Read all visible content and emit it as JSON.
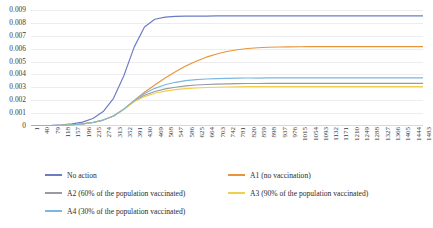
{
  "chart_data": {
    "type": "line",
    "title": "",
    "title_visibility": "cropped at top edge, illegible",
    "xlabel": "",
    "ylabel": "",
    "xlim": [
      1,
      1483
    ],
    "ylim": [
      0,
      0.009
    ],
    "grid": true,
    "grid_axis": "y",
    "legend_position": "bottom",
    "x_tick_step": 39,
    "x": [
      1,
      40,
      79,
      118,
      157,
      196,
      235,
      274,
      313,
      352,
      391,
      430,
      469,
      508,
      547,
      586,
      625,
      664,
      703,
      742,
      781,
      820,
      859,
      898,
      937,
      976,
      1015,
      1054,
      1093,
      1132,
      1171,
      1210,
      1249,
      1288,
      1327,
      1366,
      1405,
      1444,
      1483
    ],
    "y_ticks": [
      "0",
      "0.001",
      "0.002",
      "0.003",
      "0.004",
      "0.005",
      "0.006",
      "0.007",
      "0.008",
      "0.009"
    ],
    "series": [
      {
        "name": "No action",
        "color": "#6c7cc4",
        "values": [
          2e-05,
          3e-05,
          5e-05,
          9e-05,
          0.00016,
          0.0003,
          0.00058,
          0.00112,
          0.00215,
          0.0039,
          0.00612,
          0.00768,
          0.00828,
          0.00845,
          0.0085,
          0.00852,
          0.00853,
          0.00853,
          0.00854,
          0.00854,
          0.00854,
          0.00854,
          0.00854,
          0.00854,
          0.00854,
          0.00854,
          0.00854,
          0.00854,
          0.00854,
          0.00854,
          0.00854,
          0.00854,
          0.00854,
          0.00854,
          0.00854,
          0.00854,
          0.00854,
          0.00854,
          0.00854
        ]
      },
      {
        "name": "A1 (no vaccination)",
        "color": "#e8943a",
        "values": [
          2e-05,
          3e-05,
          4e-05,
          6e-05,
          0.0001,
          0.00016,
          0.00027,
          0.00046,
          0.00078,
          0.00131,
          0.00198,
          0.00262,
          0.00318,
          0.00372,
          0.00421,
          0.00465,
          0.00503,
          0.00534,
          0.00559,
          0.00578,
          0.00592,
          0.00601,
          0.00607,
          0.00611,
          0.00613,
          0.00614,
          0.00615,
          0.00616,
          0.00616,
          0.00616,
          0.00616,
          0.00616,
          0.00616,
          0.00616,
          0.00616,
          0.00616,
          0.00616,
          0.00616,
          0.00616
        ]
      },
      {
        "name": "A2 (60% of the population vaccinated)",
        "color": "#9a9aa2",
        "values": [
          2e-05,
          3e-05,
          4e-05,
          6e-05,
          0.0001,
          0.00016,
          0.00027,
          0.00046,
          0.00078,
          0.0013,
          0.00193,
          0.00238,
          0.00268,
          0.00288,
          0.00301,
          0.00311,
          0.00318,
          0.00322,
          0.00325,
          0.00327,
          0.00329,
          0.0033,
          0.0033,
          0.00331,
          0.00331,
          0.00331,
          0.00331,
          0.00331,
          0.00331,
          0.00331,
          0.00331,
          0.00331,
          0.00331,
          0.00331,
          0.00331,
          0.00331,
          0.00331,
          0.00331,
          0.00331
        ]
      },
      {
        "name": "A3 (90% of the population vaccinated)",
        "color": "#f0cf4e",
        "values": [
          2e-05,
          3e-05,
          4e-05,
          6e-05,
          0.0001,
          0.00016,
          0.00027,
          0.00046,
          0.00077,
          0.00128,
          0.00188,
          0.00228,
          0.00254,
          0.00271,
          0.00282,
          0.0029,
          0.00295,
          0.00299,
          0.00301,
          0.00303,
          0.00304,
          0.00305,
          0.00305,
          0.00306,
          0.00306,
          0.00306,
          0.00306,
          0.00306,
          0.00306,
          0.00306,
          0.00306,
          0.00306,
          0.00306,
          0.00306,
          0.00306,
          0.00306,
          0.00306,
          0.00306,
          0.00306
        ]
      },
      {
        "name": "A4 (30% of the population vaccinated)",
        "color": "#7bb7de",
        "values": [
          2e-05,
          3e-05,
          4e-05,
          6e-05,
          0.0001,
          0.00016,
          0.00027,
          0.00046,
          0.00078,
          0.00131,
          0.00197,
          0.00252,
          0.00292,
          0.0032,
          0.00339,
          0.00352,
          0.0036,
          0.00365,
          0.00368,
          0.0037,
          0.00371,
          0.00372,
          0.00372,
          0.00373,
          0.00373,
          0.00373,
          0.00373,
          0.00373,
          0.00373,
          0.00373,
          0.00373,
          0.00373,
          0.00373,
          0.00373,
          0.00373,
          0.00373,
          0.00373,
          0.00373,
          0.00373
        ]
      }
    ]
  },
  "legend": {
    "rows": [
      [
        {
          "label": "No action",
          "color": "#6c7cc4",
          "left": 45
        },
        {
          "label": "A1 (no vaccination)",
          "color": "#e8943a",
          "left": 228
        }
      ],
      [
        {
          "label": "A2 (60% of the population vaccinated)",
          "color": "#9a9aa2",
          "left": 45
        },
        {
          "label": "A3 (90% of the population vaccinated)",
          "color": "#f0cf4e",
          "left": 228
        }
      ],
      [
        {
          "label": "A4 (30% of the population vaccinated)",
          "color": "#7bb7de",
          "left": 45
        }
      ]
    ]
  }
}
